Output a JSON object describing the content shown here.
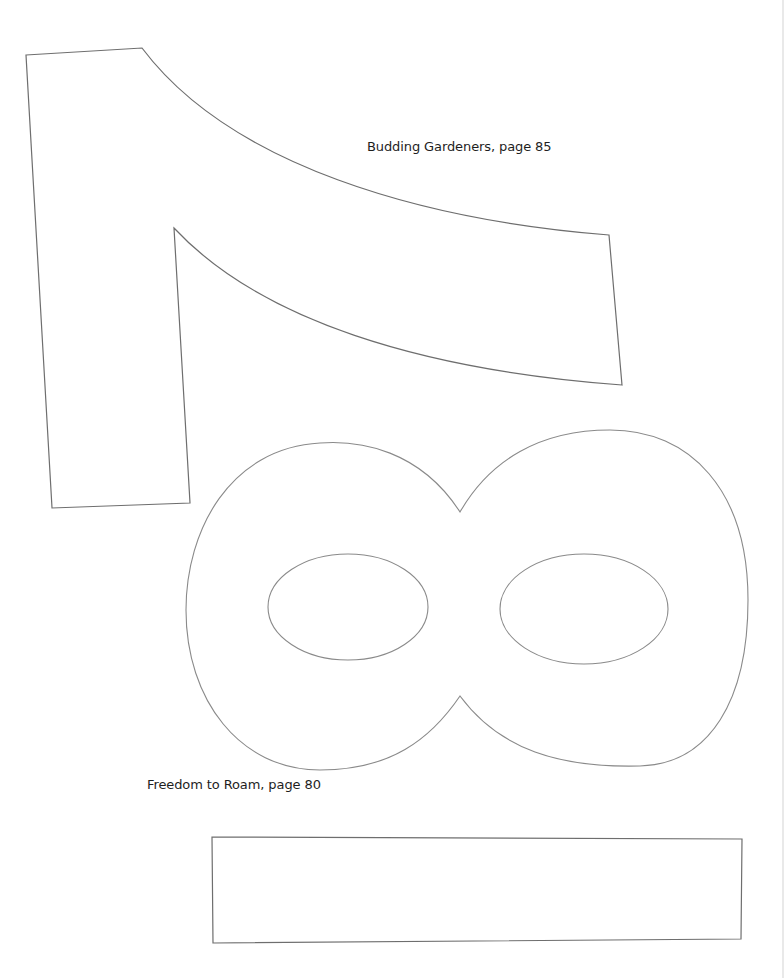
{
  "document": {
    "type": "craft-template-sheet",
    "captions": {
      "top": "Budding Gardeners, page 85",
      "bottom": "Freedom to Roam, page 80"
    },
    "shapes": [
      {
        "name": "numeral-one-outline",
        "label": "1"
      },
      {
        "name": "numeral-eight-outline",
        "label": "8"
      },
      {
        "name": "rectangle-outline",
        "label": "rectangle"
      }
    ],
    "colors": {
      "background": "#ffffff",
      "stroke": "#6e6e6e",
      "text": "#1e1e1e"
    }
  }
}
